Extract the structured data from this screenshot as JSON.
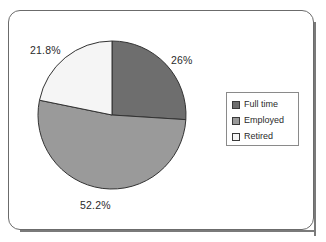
{
  "chart_data": {
    "type": "pie",
    "title": "",
    "categories": [
      "Full time",
      "Employed",
      "Retired"
    ],
    "values": [
      26,
      52.2,
      21.8
    ],
    "value_labels": [
      "26%",
      "52.2%",
      "21.8%"
    ],
    "colors": [
      "#6e6e6e",
      "#9a9a9a",
      "#f5f5f5"
    ],
    "start_angle_deg": 0,
    "direction": "clockwise",
    "legend_position": "right",
    "grid": false,
    "units": "percent"
  },
  "labels": {
    "fulltime_pct": "26%",
    "employed_pct": "52.2%",
    "retired_pct": "21.8%"
  },
  "legend": {
    "items": [
      {
        "label": "Full time",
        "color": "#6e6e6e"
      },
      {
        "label": "Employed",
        "color": "#9a9a9a"
      },
      {
        "label": "Retired",
        "color": "#f5f5f5"
      }
    ]
  }
}
